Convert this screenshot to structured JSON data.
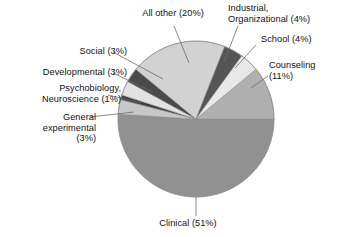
{
  "chart_data": {
    "type": "pie",
    "title": "",
    "subtitle": "",
    "xlabel": "",
    "ylabel": "",
    "legend_position": "none",
    "grid": false,
    "units": "percent",
    "total": 100,
    "start_angle_deg": 0,
    "direction": "clockwise",
    "categories": [
      "Clinical",
      "General experimental",
      "Psychobiology, Neuroscience",
      "Developmental",
      "Social",
      "All other",
      "Industrial, Organizational",
      "School",
      "Counseling"
    ],
    "values": [
      51,
      3,
      1,
      3,
      3,
      20,
      4,
      4,
      11
    ],
    "slices": [
      {
        "name": "Clinical",
        "value": 51,
        "label": "Clinical (51%)",
        "color": "#919191"
      },
      {
        "name": "General experimental",
        "value": 3,
        "label": "General experimental (3%)",
        "color": "#c8c8c8"
      },
      {
        "name": "Psychobiology, Neuroscience",
        "value": 1,
        "label": "Psychobiology, Neuroscience (1%)",
        "color": "#3f3f3f"
      },
      {
        "name": "Developmental",
        "value": 3,
        "label": "Developmental (3%)",
        "color": "#e2e2e2"
      },
      {
        "name": "Social",
        "value": 3,
        "label": "Social (3%)",
        "color": "#4a4a4a"
      },
      {
        "name": "All other",
        "value": 20,
        "label": "All other (20%)",
        "color": "#d2d2d2"
      },
      {
        "name": "Industrial, Organizational",
        "value": 4,
        "label": "Industrial, Organizational (4%)",
        "color": "#555555"
      },
      {
        "name": "School",
        "value": 4,
        "label": "School (4%)",
        "color": "#e8e8e8"
      },
      {
        "name": "Counseling",
        "value": 11,
        "label": "Counseling (11%)",
        "color": "#b0b0b0"
      }
    ]
  },
  "labels": {
    "all_other": "All other (20%)",
    "industrial_line1": "Industrial,",
    "industrial_line2": "Organizational (4%)",
    "school": "School (4%)",
    "counseling_line1": "Counseling",
    "counseling_line2": "(11%)",
    "social": "Social (3%)",
    "developmental": "Developmental (3%)",
    "psychobiology_line1": "Psychobiology,",
    "psychobiology_line2": "Neuroscience (1%)",
    "general_line1": "General",
    "general_line2": "experimental",
    "general_line3": "(3%)",
    "clinical": "Clinical (51%)"
  },
  "colors": {
    "background": "#ffffff",
    "text": "#111111",
    "leader_line": "#6b6b6b",
    "pie_outline": "#8a8a8a"
  }
}
